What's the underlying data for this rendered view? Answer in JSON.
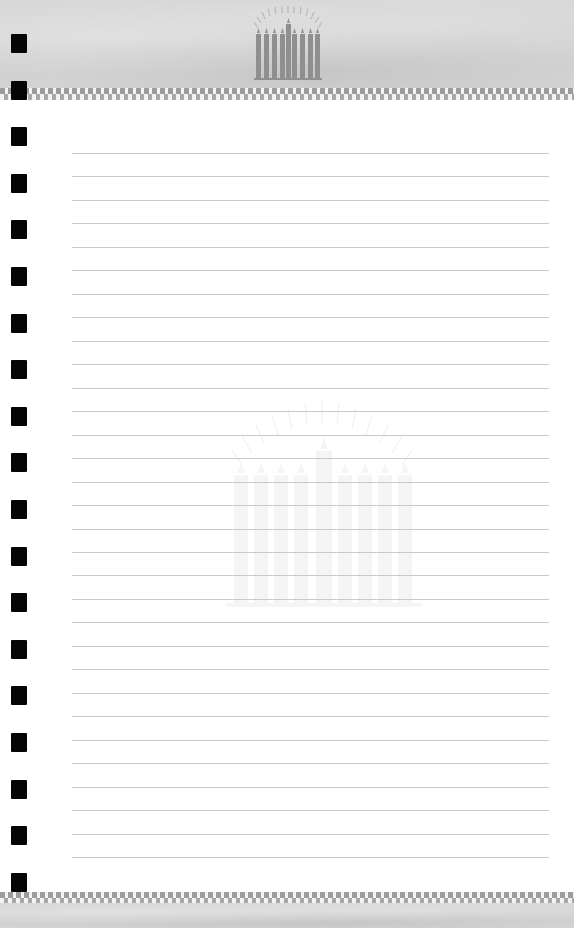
{
  "document": {
    "type": "lined-notepad-page",
    "ruled_line_count": 31,
    "punch_hole_count": 19,
    "header_logo": "menorah-icon",
    "watermark": "menorah-watermark-icon"
  },
  "colors": {
    "paper": "#ffffff",
    "band_gray": "#d2d2d2",
    "checker_dark": "#9c9c9c",
    "rule_line": "#c9c9c9",
    "hole": "#050505",
    "logo_gray": "#8f8f8f"
  }
}
